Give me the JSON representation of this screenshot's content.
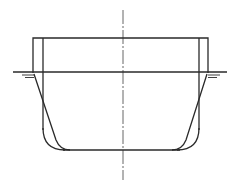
{
  "diagram": {
    "type": "technical-drawing",
    "colors": {
      "background": "#ffffff",
      "line": "#2a2a2a",
      "centerline": "#555555"
    }
  }
}
